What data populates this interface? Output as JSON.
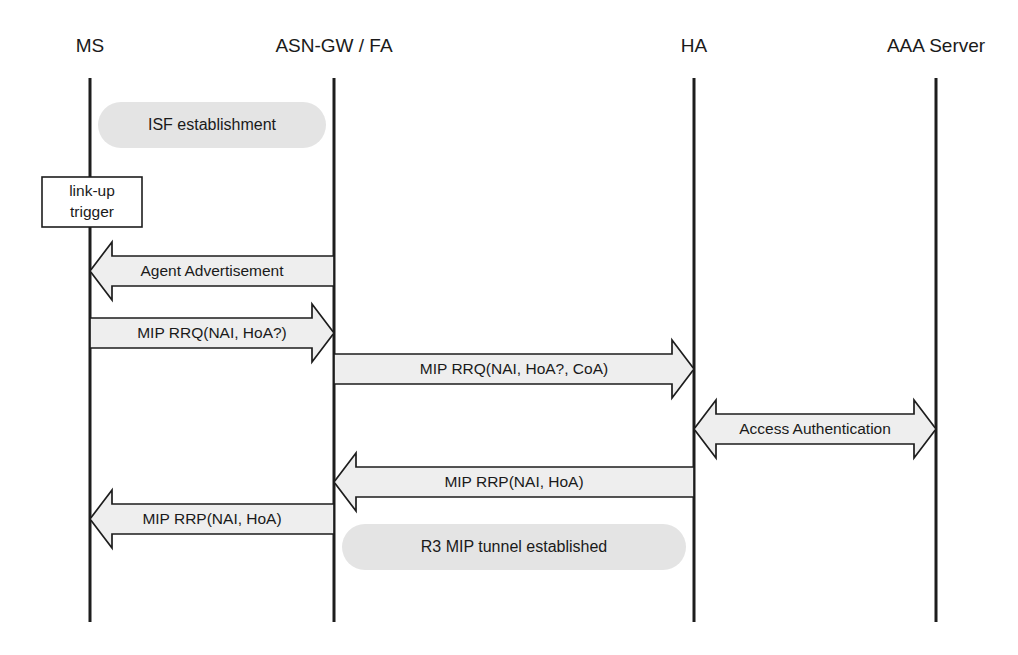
{
  "diagram": {
    "canvas": {
      "width": 1018,
      "height": 655
    },
    "colors": {
      "line": "#1d1d1d",
      "arrow_fill": "#eeeeee",
      "phase_fill": "#e4e4e4",
      "note_fill": "#ffffff",
      "background": "#ffffff",
      "text": "#1a1a1a"
    },
    "lifelines": [
      {
        "id": "ms",
        "label": "MS",
        "x": 90,
        "top": 78,
        "bottom": 622
      },
      {
        "id": "asngw",
        "label": "ASN-GW / FA",
        "x": 334,
        "top": 78,
        "bottom": 622
      },
      {
        "id": "ha",
        "label": "HA",
        "x": 694,
        "top": 78,
        "bottom": 622
      },
      {
        "id": "aaa",
        "label": "AAA Server",
        "x": 936,
        "top": 78,
        "bottom": 622
      }
    ],
    "lifeline_label_y": 52,
    "phases": [
      {
        "id": "isf",
        "label": "ISF establishment",
        "from": "ms",
        "to": "asngw",
        "y": 102,
        "height": 46
      },
      {
        "id": "r3tunnel",
        "label": "R3 MIP tunnel established",
        "from": "asngw",
        "to": "ha",
        "y": 524,
        "height": 46
      }
    ],
    "notes": [
      {
        "id": "link-up-trigger",
        "lines": [
          "link-up",
          "trigger"
        ],
        "x": 42,
        "y": 177,
        "width": 100,
        "height": 50
      }
    ],
    "messages": [
      {
        "id": "agent-advertisement",
        "label": "Agent Advertisement",
        "from": "asngw",
        "to": "ms",
        "direction": "left",
        "y": 242,
        "head_height": 58,
        "shaft_height": 30,
        "head_width": 22
      },
      {
        "id": "mip-rrq-ms-fa",
        "label": "MIP RRQ(NAI, HoA?)",
        "from": "ms",
        "to": "asngw",
        "direction": "right",
        "y": 304,
        "head_height": 58,
        "shaft_height": 30,
        "head_width": 22
      },
      {
        "id": "mip-rrq-fa-ha",
        "label": "MIP RRQ(NAI, HoA?, CoA)",
        "from": "asngw",
        "to": "ha",
        "direction": "right",
        "y": 340,
        "head_height": 58,
        "shaft_height": 30,
        "head_width": 22
      },
      {
        "id": "access-authentication",
        "label": "Access Authentication",
        "from": "ha",
        "to": "aaa",
        "direction": "both",
        "y": 400,
        "head_height": 58,
        "shaft_height": 30,
        "head_width": 22
      },
      {
        "id": "mip-rrp-ha-fa",
        "label": "MIP RRP(NAI, HoA)",
        "from": "ha",
        "to": "asngw",
        "direction": "left",
        "y": 453,
        "head_height": 58,
        "shaft_height": 30,
        "head_width": 22
      },
      {
        "id": "mip-rrp-fa-ms",
        "label": "MIP RRP(NAI, HoA)",
        "from": "asngw",
        "to": "ms",
        "direction": "left",
        "y": 490,
        "head_height": 58,
        "shaft_height": 30,
        "head_width": 22
      }
    ]
  }
}
